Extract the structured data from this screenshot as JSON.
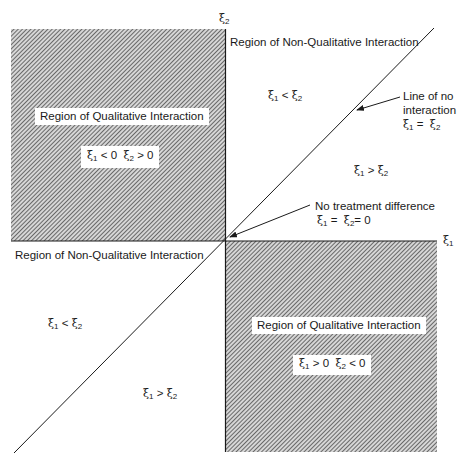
{
  "diagram": {
    "type": "quadrant-diagram",
    "axes": {
      "x_label": "ξ",
      "x_sub": "1",
      "y_label": "ξ",
      "y_sub": "2"
    },
    "regions": {
      "top_left": {
        "title": "Region of Qualitative Interaction",
        "condition": {
          "a_sym": "ξ",
          "a_sub": "1",
          "a_rel": "< 0",
          "b_sym": "ξ",
          "b_sub": "2",
          "b_rel": "> 0"
        },
        "fill": "hatched"
      },
      "bottom_right": {
        "title": "Region of Qualitative Interaction",
        "condition": {
          "a_sym": "ξ",
          "a_sub": "1",
          "a_rel": "> 0",
          "b_sym": "ξ",
          "b_sub": "2",
          "b_rel": "< 0"
        },
        "fill": "hatched"
      },
      "top_right": {
        "title": "Region of Non-Qualitative Interaction"
      },
      "bottom_left": {
        "title": "Region of Non-Qualitative Interaction"
      }
    },
    "inequalities": {
      "tr_upper": {
        "a": "ξ",
        "a_sub": "1",
        "rel": "<",
        "b": "ξ",
        "b_sub": "2"
      },
      "tr_lower": {
        "a": "ξ",
        "a_sub": "1",
        "rel": ">",
        "b": "ξ",
        "b_sub": "2"
      },
      "bl_upper": {
        "a": "ξ",
        "a_sub": "1",
        "rel": "<",
        "b": "ξ",
        "b_sub": "2"
      },
      "bl_lower": {
        "a": "ξ",
        "a_sub": "1",
        "rel": ">",
        "b": "ξ",
        "b_sub": "2"
      }
    },
    "annotations": {
      "no_interaction": {
        "line1": "Line of no",
        "line2": "interaction",
        "eq_a": "ξ",
        "eq_a_sub": "1",
        "eq_rel": "=",
        "eq_b": "ξ",
        "eq_b_sub": "2"
      },
      "no_difference": {
        "line1": "No treatment difference",
        "eq_a": "ξ",
        "eq_a_sub": "1",
        "eq_rel": "=",
        "eq_b": "ξ",
        "eq_b_sub": "2",
        "eq_tail": "= 0"
      }
    },
    "colors": {
      "ink": "#1a1a1a",
      "hatch_bg": "#c8c8c8",
      "hatch_line": "#3a3a3a",
      "background": "#ffffff"
    }
  }
}
